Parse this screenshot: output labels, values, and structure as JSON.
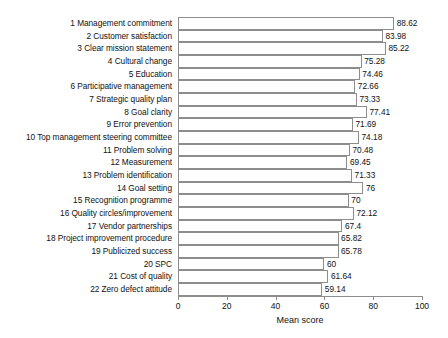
{
  "chart_data": {
    "type": "bar",
    "orientation": "horizontal",
    "title": "",
    "xlabel": "Mean score",
    "ylabel": "",
    "xlim": [
      0,
      100
    ],
    "xticks": [
      0,
      20,
      40,
      60,
      80,
      100
    ],
    "grid": false,
    "legend": null,
    "show_value_labels": true,
    "categories": [
      "1 Management commitment",
      "2 Customer satisfaction",
      "3 Clear mission statement",
      "4 Cultural change",
      "5 Education",
      "6 Participative management",
      "7 Strategic quality plan",
      "8 Goal clarity",
      "9 Error prevention",
      "10 Top management steering committee",
      "11 Problem solving",
      "12 Measurement",
      "13 Problem identification",
      "14 Goal setting",
      "15 Recognition programme",
      "16 Quality circles/improvement",
      "17 Vendor partnerships",
      "18 Project improvement procedure",
      "19 Publicized success",
      "20 SPC",
      "21 Cost of quality",
      "22 Zero defect attitude"
    ],
    "values": [
      88.62,
      83.98,
      85.22,
      75.28,
      74.46,
      72.66,
      73.33,
      77.41,
      71.69,
      74.18,
      70.48,
      69.45,
      71.33,
      76,
      70,
      72.12,
      67.4,
      65.82,
      65.78,
      60,
      61.64,
      59.14
    ],
    "value_labels": [
      "88.62",
      "83.98",
      "85.22",
      "75.28",
      "74.46",
      "72.66",
      "73.33",
      "77.41",
      "71.69",
      "74.18",
      "70.48",
      "69.45",
      "71.33",
      "76",
      "70",
      "72.12",
      "67.4",
      "65.82",
      "65.78",
      "60",
      "61.64",
      "59.14"
    ],
    "colors": {
      "bar_fill": "#ffffff",
      "bar_border": "#8d8d8d",
      "axis": "#8d8d8d",
      "text": "#111111",
      "background": "#ffffff"
    }
  }
}
